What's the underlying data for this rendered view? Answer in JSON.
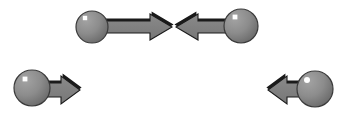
{
  "figure": {
    "background_color": "#ffffff",
    "width": 348,
    "height": 122
  },
  "palette": {
    "sphere_fill": "#8c8c8c",
    "sphere_fill_dark": "#6f6f6f",
    "sphere_outline": "#3a3a3a",
    "sphere_highlight": "#ffffff",
    "arrow_fill": "#7d7d7d",
    "arrow_outline": "#1a1a1a",
    "arrow_shadow": "#1a1a1a",
    "background": "#ffffff"
  },
  "groups": [
    {
      "id": "top-pair",
      "label": "Top colliding pair",
      "elements": [
        {
          "id": "sphere-top-left",
          "kind": "sphere",
          "cx": 92,
          "cy": 27,
          "r": 16,
          "highlight_x": 85,
          "highlight_y": 18,
          "highlight_r": 2.2,
          "highlight_shape": "square"
        },
        {
          "id": "arrow-top-left",
          "kind": "arrow",
          "direction": "right",
          "tail_x": 104,
          "tip_x": 172,
          "center_y": 27,
          "shaft_half_height": 6,
          "head_half_height": 13,
          "head_length": 22,
          "label": "rightward motion arrow"
        },
        {
          "id": "arrow-top-right",
          "kind": "arrow",
          "direction": "left",
          "tail_x": 236,
          "tip_x": 176,
          "center_y": 27,
          "shaft_half_height": 6,
          "head_half_height": 13,
          "head_length": 22,
          "label": "leftward motion arrow"
        },
        {
          "id": "sphere-top-right",
          "kind": "sphere",
          "cx": 241,
          "cy": 26,
          "r": 17,
          "highlight_x": 235,
          "highlight_y": 17,
          "highlight_r": 2.4,
          "highlight_shape": "square"
        }
      ]
    },
    {
      "id": "bottom-left-unit",
      "label": "Bottom left particle moving right",
      "elements": [
        {
          "id": "sphere-bottom-left",
          "kind": "sphere",
          "cx": 32,
          "cy": 88,
          "r": 18,
          "highlight_x": 25,
          "highlight_y": 79,
          "highlight_r": 2.4,
          "highlight_shape": "square"
        },
        {
          "id": "arrow-bottom-left",
          "kind": "arrow",
          "direction": "right",
          "tail_x": 38,
          "tip_x": 80,
          "center_y": 90,
          "shaft_half_height": 7,
          "head_half_height": 14,
          "head_length": 19,
          "label": "rightward motion arrow"
        }
      ]
    },
    {
      "id": "bottom-right-unit",
      "label": "Bottom right particle moving left",
      "elements": [
        {
          "id": "sphere-bottom-right",
          "kind": "sphere",
          "cx": 315,
          "cy": 89,
          "r": 18,
          "highlight_x": 307,
          "highlight_y": 80,
          "highlight_r": 3.0,
          "highlight_shape": "circle"
        },
        {
          "id": "arrow-bottom-right",
          "kind": "arrow",
          "direction": "left",
          "tail_x": 310,
          "tip_x": 268,
          "center_y": 90,
          "shaft_half_height": 7,
          "head_half_height": 14,
          "head_length": 19,
          "label": "leftward motion arrow"
        }
      ]
    }
  ]
}
